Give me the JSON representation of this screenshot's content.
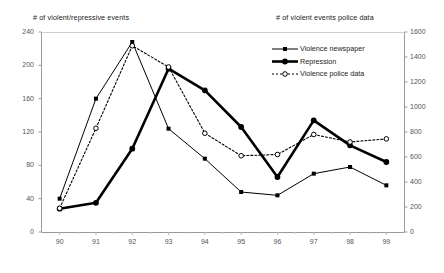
{
  "chart_data": {
    "type": "line",
    "title": "",
    "categories": [
      "90",
      "91",
      "92",
      "93",
      "94",
      "95",
      "96",
      "97",
      "98",
      "99"
    ],
    "x": [
      90,
      91,
      92,
      93,
      94,
      95,
      96,
      97,
      98,
      99
    ],
    "xlabel": "",
    "left_axis": {
      "label": "# of violent/repressive events",
      "ticks": [
        0,
        40,
        80,
        120,
        160,
        200,
        240
      ],
      "ylim": [
        0,
        240
      ]
    },
    "right_axis": {
      "label": "# of violent events police data",
      "ticks": [
        0,
        200,
        400,
        600,
        800,
        1000,
        1200,
        1400,
        1600
      ],
      "ylim": [
        0,
        1600
      ]
    },
    "grid": false,
    "legend_position": "upper-right",
    "series": [
      {
        "name": "Violence newspaper",
        "axis": "left",
        "style": "thin-solid",
        "marker": "filled-square",
        "color": "#000000",
        "values": [
          40,
          160,
          228,
          124,
          88,
          48,
          44,
          70,
          78,
          56
        ]
      },
      {
        "name": "Repression",
        "axis": "left",
        "style": "thick-solid",
        "marker": "filled-circle",
        "color": "#000000",
        "values": [
          28,
          35,
          100,
          196,
          170,
          126,
          66,
          134,
          104,
          84
        ]
      },
      {
        "name": "Violence police data",
        "axis": "right",
        "style": "dotted",
        "marker": "open-circle",
        "color": "#000000",
        "values": [
          190,
          830,
          1490,
          1320,
          790,
          610,
          620,
          780,
          720,
          745
        ]
      }
    ]
  },
  "legend": {
    "items": [
      {
        "label": "Violence newspaper"
      },
      {
        "label": "Repression"
      },
      {
        "label": "Violence police data"
      }
    ]
  },
  "left_axis_ticks": [
    "240",
    "200",
    "160",
    "120",
    "80",
    "40",
    "0"
  ],
  "right_axis_ticks": [
    "1600",
    "1400",
    "1200",
    "1000",
    "800",
    "600",
    "400",
    "200",
    "0"
  ],
  "x_axis_ticks": [
    "90",
    "91",
    "92",
    "93",
    "94",
    "95",
    "96",
    "97",
    "98",
    "99"
  ]
}
